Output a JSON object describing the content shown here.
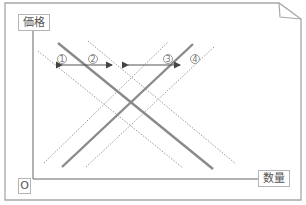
{
  "diagram": {
    "axes": {
      "y_label": "価格",
      "x_label": "数量",
      "origin_label": "O"
    },
    "markers": [
      {
        "id": "1",
        "glyph": "①"
      },
      {
        "id": "2",
        "glyph": "②"
      },
      {
        "id": "3",
        "glyph": "③"
      },
      {
        "id": "4",
        "glyph": "④"
      }
    ],
    "curves": [
      {
        "name": "demand",
        "style": "solid",
        "direction": "down-right"
      },
      {
        "name": "supply",
        "style": "solid",
        "direction": "up-right"
      },
      {
        "name": "demand-shift-left",
        "style": "dotted"
      },
      {
        "name": "demand-shift-right",
        "style": "dotted"
      },
      {
        "name": "supply-shift-left",
        "style": "dotted"
      },
      {
        "name": "supply-shift-right",
        "style": "dotted"
      }
    ],
    "arrows": [
      {
        "name": "demand-shift-arrow",
        "between": [
          "1",
          "2"
        ]
      },
      {
        "name": "supply-shift-arrow",
        "between": [
          "3",
          "4"
        ]
      }
    ],
    "colors": {
      "frame": "#a8a8a8",
      "axis": "#666666",
      "curve": "#8a8a8a",
      "dotted": "#9a9a9a",
      "arrow": "#444444"
    }
  }
}
